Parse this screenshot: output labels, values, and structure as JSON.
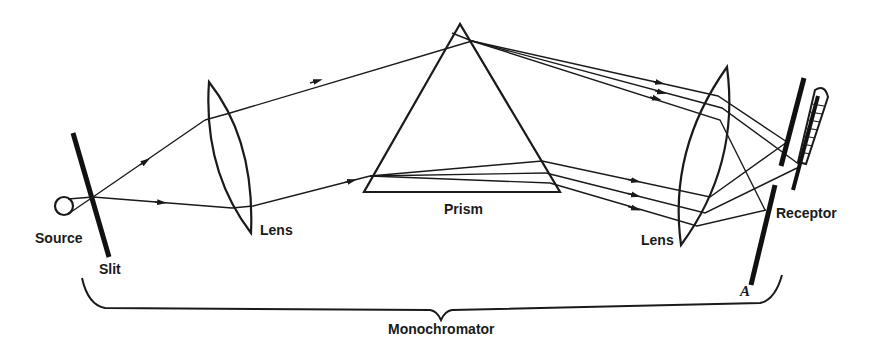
{
  "diagram": {
    "title": "Monochromator",
    "labels": {
      "source": "Source",
      "slit": "Slit",
      "lens_left": "Lens",
      "prism": "Prism",
      "lens_right": "Lens",
      "receptor": "Receptor",
      "mirror_a": "A",
      "monochromator": "Monochromator"
    },
    "components": [
      "source",
      "slit",
      "lens",
      "prism",
      "lens",
      "mirror A",
      "receptor (thermocouple)"
    ],
    "colors": {
      "ink": "#1a1a1a",
      "background": "#ffffff"
    }
  }
}
